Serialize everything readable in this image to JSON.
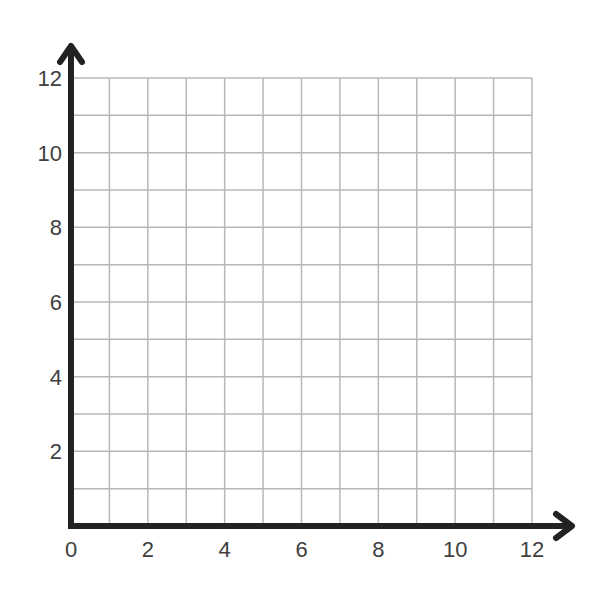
{
  "chart_data": {
    "type": "scatter",
    "title": "",
    "xlabel": "",
    "ylabel": "",
    "xlim": [
      0,
      12
    ],
    "ylim": [
      0,
      12
    ],
    "grid": true,
    "grid_step": 1,
    "x_ticks": [
      "0",
      "2",
      "4",
      "6",
      "8",
      "10",
      "12"
    ],
    "y_ticks": [
      "2",
      "4",
      "6",
      "8",
      "10",
      "12"
    ],
    "series": [],
    "legend": null
  },
  "colors": {
    "axis": "#222222",
    "grid": "#b8b8b8",
    "tick_label": "#404040",
    "background": "#ffffff"
  }
}
